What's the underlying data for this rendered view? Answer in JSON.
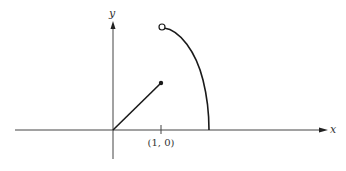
{
  "diagram": {
    "axes": {
      "x_label": "x",
      "y_label": "y"
    },
    "tick": {
      "label": "(1, 0)"
    },
    "elements": [
      {
        "type": "segment",
        "from": "origin",
        "to": "filled-point",
        "description": "line from origin ending in a filled dot"
      },
      {
        "type": "curve",
        "from": "open-point",
        "to": "x-axis",
        "description": "curve starting at an open circle and descending to the x-axis"
      }
    ],
    "colors": {
      "stroke": "#1a1a1a",
      "axis": "#333333",
      "background": "#ffffff"
    }
  }
}
